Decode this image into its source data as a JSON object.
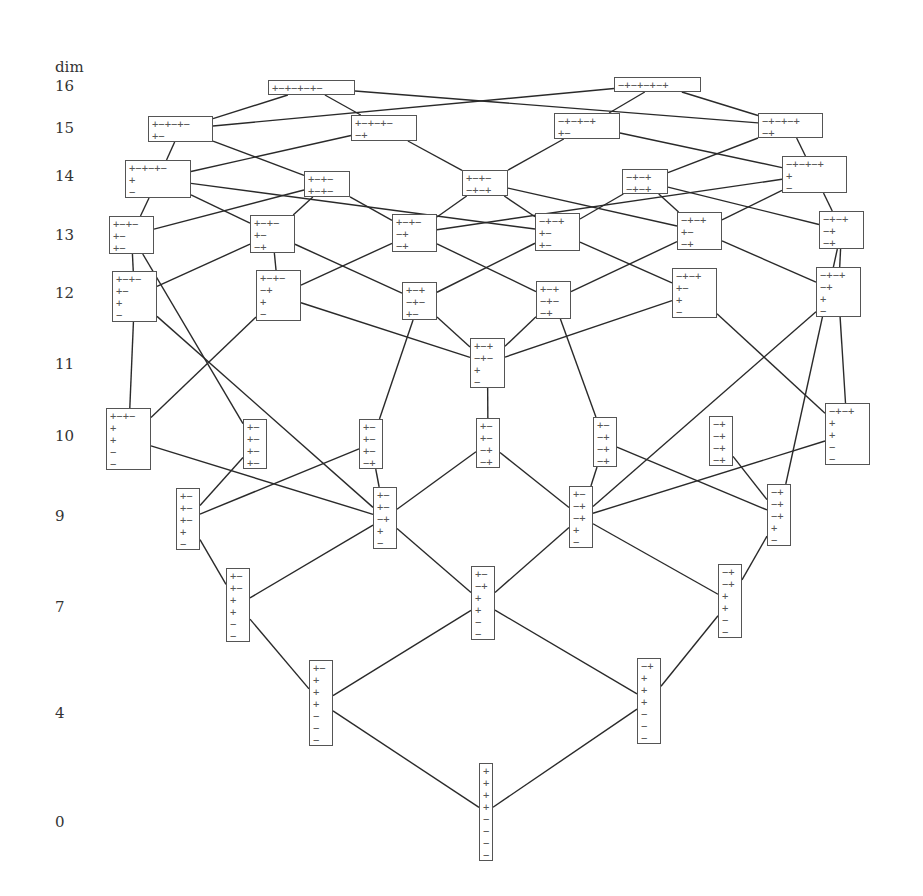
{
  "axis": {
    "title": "dim",
    "levels": [
      {
        "label": "16",
        "y": 87
      },
      {
        "label": "15",
        "y": 129
      },
      {
        "label": "14",
        "y": 177
      },
      {
        "label": "13",
        "y": 236
      },
      {
        "label": "12",
        "y": 294
      },
      {
        "label": "11",
        "y": 365
      },
      {
        "label": "10",
        "y": 437
      },
      {
        "label": "9",
        "y": 517
      },
      {
        "label": "7",
        "y": 608
      },
      {
        "label": "4",
        "y": 714
      },
      {
        "label": "0",
        "y": 823
      }
    ]
  },
  "nodes": [
    {
      "id": "d16a",
      "dim": "16",
      "x": 268,
      "y": 80,
      "w": 87,
      "h": 15,
      "rows": [
        "+−+−+−+−"
      ]
    },
    {
      "id": "d16b",
      "dim": "16",
      "x": 614,
      "y": 77,
      "w": 87,
      "h": 15,
      "rows": [
        "−+−+−+−+"
      ]
    },
    {
      "id": "d15a",
      "dim": "15",
      "x": 148,
      "y": 116,
      "w": 65,
      "h": 26,
      "rows": [
        "+−+−+−",
        "+−"
      ]
    },
    {
      "id": "d15b",
      "dim": "15",
      "x": 351,
      "y": 115,
      "w": 66,
      "h": 26,
      "rows": [
        "+−+−+−",
        "−+"
      ]
    },
    {
      "id": "d15c",
      "dim": "15",
      "x": 554,
      "y": 113,
      "w": 66,
      "h": 26,
      "rows": [
        "−+−+−+",
        "+−"
      ]
    },
    {
      "id": "d15d",
      "dim": "15",
      "x": 758,
      "y": 113,
      "w": 65,
      "h": 25,
      "rows": [
        "−+−+−+",
        "−+"
      ]
    },
    {
      "id": "d14a",
      "dim": "14",
      "x": 125,
      "y": 160,
      "w": 66,
      "h": 38,
      "rows": [
        "+−+−+−",
        "+",
        "−"
      ]
    },
    {
      "id": "d14b",
      "dim": "14",
      "x": 304,
      "y": 171,
      "w": 46,
      "h": 26,
      "rows": [
        "+−+−",
        "+−+−"
      ]
    },
    {
      "id": "d14c",
      "dim": "14",
      "x": 462,
      "y": 170,
      "w": 46,
      "h": 26,
      "rows": [
        "+−+−",
        "−+−+"
      ]
    },
    {
      "id": "d14d",
      "dim": "14",
      "x": 622,
      "y": 169,
      "w": 46,
      "h": 25,
      "rows": [
        "−+−+",
        "−+−+"
      ]
    },
    {
      "id": "d14e",
      "dim": "14",
      "x": 782,
      "y": 156,
      "w": 65,
      "h": 37,
      "rows": [
        "−+−+−+",
        "+",
        "−"
      ]
    },
    {
      "id": "d13a",
      "dim": "13",
      "x": 109,
      "y": 216,
      "w": 45,
      "h": 38,
      "rows": [
        "+−+−",
        "+−",
        "+−"
      ]
    },
    {
      "id": "d13b",
      "dim": "13",
      "x": 250,
      "y": 215,
      "w": 45,
      "h": 38,
      "rows": [
        "+−+−",
        "+−",
        "−+"
      ]
    },
    {
      "id": "d13c",
      "dim": "13",
      "x": 392,
      "y": 214,
      "w": 45,
      "h": 38,
      "rows": [
        "+−+−",
        "−+",
        "−+"
      ]
    },
    {
      "id": "d13d",
      "dim": "13",
      "x": 535,
      "y": 213,
      "w": 45,
      "h": 38,
      "rows": [
        "−+−+",
        "+−",
        "+−"
      ]
    },
    {
      "id": "d13e",
      "dim": "13",
      "x": 677,
      "y": 212,
      "w": 45,
      "h": 38,
      "rows": [
        "−+−+",
        "+−",
        "−+"
      ]
    },
    {
      "id": "d13f",
      "dim": "13",
      "x": 819,
      "y": 211,
      "w": 45,
      "h": 38,
      "rows": [
        "−+−+",
        "−+",
        "−+"
      ]
    },
    {
      "id": "d12a",
      "dim": "12",
      "x": 112,
      "y": 271,
      "w": 45,
      "h": 51,
      "rows": [
        "+−+−",
        "+−",
        "+",
        "−"
      ]
    },
    {
      "id": "d12b",
      "dim": "12",
      "x": 256,
      "y": 270,
      "w": 45,
      "h": 51,
      "rows": [
        "+−+−",
        "−+",
        "+",
        "−"
      ]
    },
    {
      "id": "d12c",
      "dim": "12",
      "x": 402,
      "y": 282,
      "w": 35,
      "h": 38,
      "rows": [
        "+−+",
        "−+−",
        "+−"
      ]
    },
    {
      "id": "d12d",
      "dim": "12",
      "x": 536,
      "y": 281,
      "w": 35,
      "h": 38,
      "rows": [
        "+−+",
        "−+−",
        "−+"
      ]
    },
    {
      "id": "d12e",
      "dim": "12",
      "x": 672,
      "y": 268,
      "w": 45,
      "h": 50,
      "rows": [
        "−+−+",
        "+−",
        "+",
        "−"
      ]
    },
    {
      "id": "d12f",
      "dim": "12",
      "x": 816,
      "y": 267,
      "w": 45,
      "h": 50,
      "rows": [
        "−+−+",
        "−+",
        "+",
        "−"
      ]
    },
    {
      "id": "d11a",
      "dim": "11",
      "x": 470,
      "y": 338,
      "w": 35,
      "h": 50,
      "rows": [
        "+−+",
        "−+−",
        "+",
        "−"
      ]
    },
    {
      "id": "d10a",
      "dim": "10",
      "x": 106,
      "y": 408,
      "w": 45,
      "h": 62,
      "rows": [
        "+−+−",
        "+",
        "+",
        "−",
        "−"
      ]
    },
    {
      "id": "d10b",
      "dim": "10",
      "x": 243,
      "y": 419,
      "w": 24,
      "h": 50,
      "rows": [
        "+−",
        "+−",
        "+−",
        "+−"
      ]
    },
    {
      "id": "d10c",
      "dim": "10",
      "x": 359,
      "y": 419,
      "w": 24,
      "h": 50,
      "rows": [
        "+−",
        "+−",
        "+−",
        "−+"
      ]
    },
    {
      "id": "d10d",
      "dim": "10",
      "x": 476,
      "y": 418,
      "w": 24,
      "h": 50,
      "rows": [
        "+−",
        "+−",
        "−+",
        "−+"
      ]
    },
    {
      "id": "d10e",
      "dim": "10",
      "x": 593,
      "y": 417,
      "w": 24,
      "h": 50,
      "rows": [
        "+−",
        "−+",
        "−+",
        "−+"
      ]
    },
    {
      "id": "d10f",
      "dim": "10",
      "x": 709,
      "y": 416,
      "w": 24,
      "h": 50,
      "rows": [
        "−+",
        "−+",
        "−+",
        "−+"
      ]
    },
    {
      "id": "d10g",
      "dim": "10",
      "x": 825,
      "y": 403,
      "w": 45,
      "h": 62,
      "rows": [
        "−+−+",
        "+",
        "+",
        "−",
        "−"
      ]
    },
    {
      "id": "d9a",
      "dim": "9",
      "x": 176,
      "y": 488,
      "w": 24,
      "h": 62,
      "rows": [
        "+−",
        "+−",
        "+−",
        "+",
        "−"
      ]
    },
    {
      "id": "d9b",
      "dim": "9",
      "x": 373,
      "y": 487,
      "w": 24,
      "h": 62,
      "rows": [
        "+−",
        "+−",
        "−+",
        "+",
        "−"
      ]
    },
    {
      "id": "d9c",
      "dim": "9",
      "x": 569,
      "y": 486,
      "w": 24,
      "h": 62,
      "rows": [
        "+−",
        "−+",
        "−+",
        "+",
        "−"
      ]
    },
    {
      "id": "d9d",
      "dim": "9",
      "x": 767,
      "y": 484,
      "w": 24,
      "h": 62,
      "rows": [
        "−+",
        "−+",
        "−+",
        "+",
        "−"
      ]
    },
    {
      "id": "d7a",
      "dim": "7",
      "x": 226,
      "y": 568,
      "w": 24,
      "h": 74,
      "rows": [
        "+−",
        "+−",
        "+",
        "+",
        "−",
        "−"
      ]
    },
    {
      "id": "d7b",
      "dim": "7",
      "x": 471,
      "y": 566,
      "w": 24,
      "h": 74,
      "rows": [
        "+−",
        "−+",
        "+",
        "+",
        "−",
        "−"
      ]
    },
    {
      "id": "d7c",
      "dim": "7",
      "x": 718,
      "y": 564,
      "w": 24,
      "h": 74,
      "rows": [
        "−+",
        "−+",
        "+",
        "+",
        "−",
        "−"
      ]
    },
    {
      "id": "d4a",
      "dim": "4",
      "x": 309,
      "y": 660,
      "w": 24,
      "h": 86,
      "rows": [
        "+−",
        "+",
        "+",
        "+",
        "−",
        "−",
        "−"
      ]
    },
    {
      "id": "d4b",
      "dim": "4",
      "x": 637,
      "y": 658,
      "w": 24,
      "h": 86,
      "rows": [
        "−+",
        "+",
        "+",
        "+",
        "−",
        "−",
        "−"
      ]
    },
    {
      "id": "d0a",
      "dim": "0",
      "x": 479,
      "y": 763,
      "w": 14,
      "h": 98,
      "rows": [
        "+",
        "+",
        "+",
        "+",
        "−",
        "−",
        "−",
        "−"
      ]
    }
  ],
  "edges": [
    [
      "d16a",
      "d15a"
    ],
    [
      "d16a",
      "d15b"
    ],
    [
      "d16a",
      "d15d"
    ],
    [
      "d16b",
      "d15a"
    ],
    [
      "d16b",
      "d15c"
    ],
    [
      "d16b",
      "d15d"
    ],
    [
      "d15a",
      "d14a"
    ],
    [
      "d15a",
      "d14b"
    ],
    [
      "d15b",
      "d14a"
    ],
    [
      "d15b",
      "d14c"
    ],
    [
      "d15c",
      "d14c"
    ],
    [
      "d15c",
      "d14e"
    ],
    [
      "d15d",
      "d14d"
    ],
    [
      "d15d",
      "d14e"
    ],
    [
      "d14a",
      "d13a"
    ],
    [
      "d14a",
      "d13b"
    ],
    [
      "d14a",
      "d13d"
    ],
    [
      "d14b",
      "d13a"
    ],
    [
      "d14b",
      "d13b"
    ],
    [
      "d14b",
      "d13c"
    ],
    [
      "d14c",
      "d13c"
    ],
    [
      "d14c",
      "d13d"
    ],
    [
      "d14c",
      "d13e"
    ],
    [
      "d14d",
      "d13d"
    ],
    [
      "d14d",
      "d13e"
    ],
    [
      "d14d",
      "d13f"
    ],
    [
      "d14e",
      "d13c"
    ],
    [
      "d14e",
      "d13e"
    ],
    [
      "d14e",
      "d13f"
    ],
    [
      "d13a",
      "d12a"
    ],
    [
      "d13a",
      "d10b"
    ],
    [
      "d13b",
      "d12a"
    ],
    [
      "d13b",
      "d12b"
    ],
    [
      "d13b",
      "d12c"
    ],
    [
      "d13c",
      "d12b"
    ],
    [
      "d13c",
      "d12d"
    ],
    [
      "d13d",
      "d12c"
    ],
    [
      "d13d",
      "d12e"
    ],
    [
      "d13e",
      "d12d"
    ],
    [
      "d13e",
      "d12f"
    ],
    [
      "d13f",
      "d12f"
    ],
    [
      "d13f",
      "d9d"
    ],
    [
      "d12a",
      "d10a"
    ],
    [
      "d12a",
      "d9b"
    ],
    [
      "d12b",
      "d10a"
    ],
    [
      "d12b",
      "d11a"
    ],
    [
      "d12c",
      "d11a"
    ],
    [
      "d12c",
      "d10c"
    ],
    [
      "d12d",
      "d11a"
    ],
    [
      "d12d",
      "d10e"
    ],
    [
      "d12e",
      "d11a"
    ],
    [
      "d12e",
      "d10g"
    ],
    [
      "d12f",
      "d10g"
    ],
    [
      "d12f",
      "d9c"
    ],
    [
      "d11a",
      "d10d"
    ],
    [
      "d10a",
      "d9b"
    ],
    [
      "d10b",
      "d9a"
    ],
    [
      "d10c",
      "d9a"
    ],
    [
      "d10c",
      "d9b"
    ],
    [
      "d10d",
      "d9b"
    ],
    [
      "d10d",
      "d9c"
    ],
    [
      "d10e",
      "d9c"
    ],
    [
      "d10e",
      "d9d"
    ],
    [
      "d10f",
      "d9d"
    ],
    [
      "d10g",
      "d9c"
    ],
    [
      "d9a",
      "d7a"
    ],
    [
      "d9b",
      "d7a"
    ],
    [
      "d9b",
      "d7b"
    ],
    [
      "d9c",
      "d7b"
    ],
    [
      "d9c",
      "d7c"
    ],
    [
      "d9d",
      "d7c"
    ],
    [
      "d7a",
      "d4a"
    ],
    [
      "d7b",
      "d4a"
    ],
    [
      "d7b",
      "d4b"
    ],
    [
      "d7c",
      "d4b"
    ],
    [
      "d4a",
      "d0a"
    ],
    [
      "d4b",
      "d0a"
    ]
  ]
}
